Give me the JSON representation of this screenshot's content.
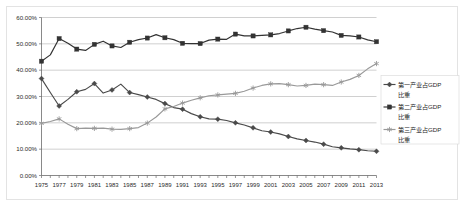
{
  "chart_data": {
    "type": "line",
    "title": "",
    "xlabel": "",
    "ylabel": "",
    "grid": true,
    "legend_position": "right",
    "ylim": [
      0,
      60
    ],
    "ytick_labels": [
      "60.00%",
      "50.00%",
      "40.00%",
      "30.00%",
      "20.00%",
      "10.00%",
      "0.00%"
    ],
    "ytick_values": [
      60,
      50,
      40,
      30,
      20,
      10,
      0
    ],
    "x": [
      1975,
      1976,
      1977,
      1978,
      1979,
      1980,
      1981,
      1982,
      1983,
      1984,
      1985,
      1986,
      1987,
      1988,
      1989,
      1990,
      1991,
      1992,
      1993,
      1994,
      1995,
      1996,
      1997,
      1998,
      1999,
      2000,
      2001,
      2002,
      2003,
      2004,
      2005,
      2006,
      2007,
      2008,
      2009,
      2010,
      2011,
      2012,
      2013
    ],
    "xtick_labels": [
      "1975",
      "1977",
      "1979",
      "1981",
      "1983",
      "1985",
      "1987",
      "1989",
      "1991",
      "1993",
      "1995",
      "1997",
      "1999",
      "2001",
      "2003",
      "2005",
      "2007",
      "2009",
      "2011",
      "2013"
    ],
    "series": [
      {
        "name": "第一产业占GDP比重",
        "marker": "diamond",
        "color": "#4a4a4a",
        "values": [
          36.8,
          31.5,
          26.4,
          28.9,
          31.8,
          32.7,
          34.9,
          31.3,
          32.5,
          34.7,
          31.5,
          30.7,
          29.8,
          28.9,
          27.3,
          25.8,
          25.2,
          23.5,
          22.3,
          21.5,
          21.4,
          20.9,
          20.0,
          19.2,
          18.1,
          17.0,
          16.5,
          15.8,
          14.8,
          13.9,
          13.3,
          12.7,
          11.9,
          10.9,
          10.5,
          10.1,
          9.8,
          9.4,
          9.2
        ],
        "label_line1": "第一产业占GDP",
        "label_line2": "比重"
      },
      {
        "name": "第二产业占GDP比重",
        "marker": "square",
        "color": "#333333",
        "values": [
          43.4,
          45.8,
          52.0,
          50.2,
          48.0,
          47.5,
          49.8,
          51.0,
          49.2,
          48.6,
          50.6,
          51.6,
          52.2,
          53.5,
          52.3,
          51.6,
          50.2,
          50.1,
          50.1,
          51.4,
          51.8,
          51.7,
          53.7,
          53.0,
          53.0,
          53.2,
          53.4,
          53.9,
          54.9,
          55.8,
          56.3,
          55.6,
          55.0,
          54.5,
          53.2,
          53.0,
          52.6,
          51.5,
          50.8
        ],
        "label_line1": "第二产业占GDP",
        "label_line2": "比重"
      },
      {
        "name": "第三产业占GDP比重",
        "marker": "star",
        "color": "#999999",
        "values": [
          19.8,
          20.5,
          21.5,
          19.5,
          17.8,
          18.0,
          17.9,
          18.0,
          17.6,
          17.5,
          17.8,
          18.2,
          19.9,
          22.2,
          25.3,
          26.2,
          27.5,
          28.6,
          29.5,
          30.3,
          30.6,
          30.9,
          31.2,
          32.0,
          33.2,
          34.2,
          34.8,
          34.9,
          34.5,
          34.0,
          34.2,
          34.7,
          34.5,
          34.2,
          35.5,
          36.5,
          38.0,
          40.5,
          42.5
        ],
        "label_line1": "第三产业占GDP",
        "label_line2": "比重"
      }
    ]
  }
}
